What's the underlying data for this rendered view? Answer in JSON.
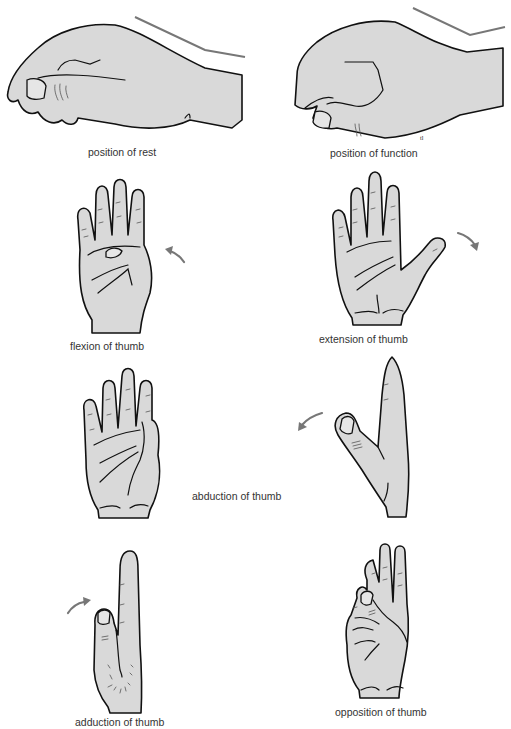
{
  "figure": {
    "panels": [
      {
        "id": "position-of-rest",
        "caption": "position of rest"
      },
      {
        "id": "position-of-function",
        "caption": "position of function"
      },
      {
        "id": "flexion-of-thumb",
        "caption": "flexion of thumb"
      },
      {
        "id": "extension-of-thumb",
        "caption": "extension of thumb"
      },
      {
        "id": "abduction-of-thumb",
        "caption": "abduction of thumb"
      },
      {
        "id": "adduction-of-thumb",
        "caption": "adduction of thumb"
      },
      {
        "id": "opposition-of-thumb",
        "caption": "opposition of thumb"
      }
    ],
    "artist_mark": "tl",
    "colors": {
      "skin": "#d9d9d9",
      "outline": "#111111",
      "arrow": "#777777",
      "background": "#ffffff"
    }
  }
}
